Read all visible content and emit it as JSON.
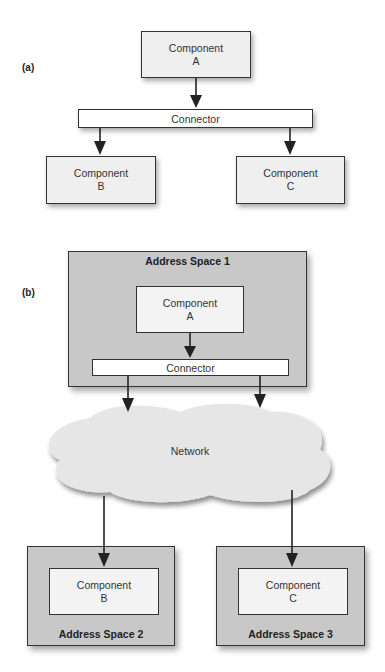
{
  "diagram_a": {
    "label": "(a)",
    "component_a": {
      "line1": "Component",
      "line2": "A"
    },
    "connector": "Connector",
    "component_b": {
      "line1": "Component",
      "line2": "B"
    },
    "component_c": {
      "line1": "Component",
      "line2": "C"
    }
  },
  "diagram_b": {
    "label": "(b)",
    "address_space_1": {
      "title": "Address Space 1",
      "component": {
        "line1": "Component",
        "line2": "A"
      },
      "connector": "Connector"
    },
    "network": "Network",
    "address_space_2": {
      "title": "Address Space 2",
      "component": {
        "line1": "Component",
        "line2": "B"
      }
    },
    "address_space_3": {
      "title": "Address Space 3",
      "component": {
        "line1": "Component",
        "line2": "C"
      }
    }
  },
  "colors": {
    "address_space_fill": "#c8c8c8",
    "component_fill": "#efefef",
    "connector_fill": "#ffffff",
    "network_fill": "#e6e6e6",
    "stroke": "#333333"
  }
}
